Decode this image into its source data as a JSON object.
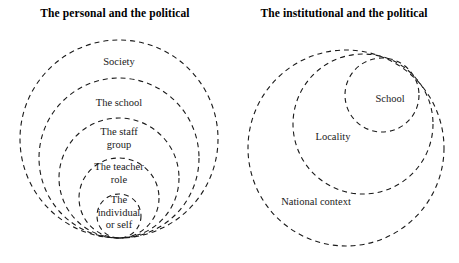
{
  "figure": {
    "width": 459,
    "height": 263,
    "background": "#ffffff",
    "stroke_color": "#1a1a1a"
  },
  "panels": [
    {
      "id": "personal",
      "title": "The personal and the political",
      "diagram": {
        "type": "nested-circles",
        "tangency": "bottom",
        "tangent_point": {
          "x": 119,
          "y": 238
        },
        "rings": [
          {
            "label": "Society",
            "cx": 119,
            "cy": 139,
            "r": 99,
            "label_x": 119,
            "label_y": 56
          },
          {
            "label": "The school",
            "cx": 119,
            "cy": 158,
            "r": 80,
            "label_x": 119,
            "label_y": 97
          },
          {
            "label": "The staff\ngroup",
            "cx": 119,
            "cy": 178,
            "r": 60,
            "label_x": 119,
            "label_y": 126
          },
          {
            "label": "The teacher\nrole",
            "cx": 119,
            "cy": 198,
            "r": 40,
            "label_x": 119,
            "label_y": 161
          },
          {
            "label": "The\nindividual\nor self",
            "cx": 119,
            "cy": 216,
            "r": 22,
            "label_x": 119,
            "label_y": 194
          }
        ]
      }
    },
    {
      "id": "institutional",
      "title": "The institutional and the political",
      "diagram": {
        "type": "nested-circles",
        "tangency": "upper-right",
        "tangent_point": {
          "x": 183,
          "y": 60
        },
        "rings": [
          {
            "label": "National context",
            "cx": 117,
            "cy": 148,
            "r": 98,
            "label_x": 87,
            "label_y": 196
          },
          {
            "label": "Locality",
            "cx": 134,
            "cy": 124,
            "r": 70,
            "label_x": 104,
            "label_y": 131
          },
          {
            "label": "School",
            "cx": 153,
            "cy": 95,
            "r": 37,
            "label_x": 161,
            "label_y": 93
          }
        ]
      }
    }
  ],
  "style": {
    "dash_pattern": "5 4",
    "stroke_width": 1.1
  }
}
